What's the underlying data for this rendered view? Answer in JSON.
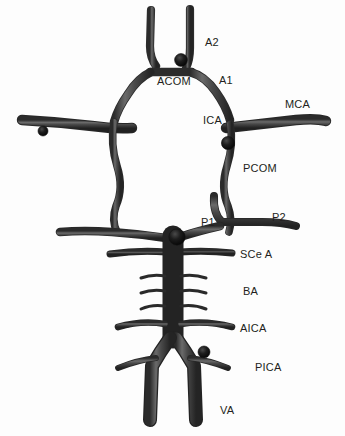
{
  "figure": {
    "background_color": "#fdfdfd",
    "vessel_color": "#3f3f3f",
    "vessel_shadow_color": "#262626",
    "vessel_highlight_color": "#6e6e6e",
    "aneurysm_color": "#131313",
    "label_color": "#231f20"
  },
  "labels": [
    {
      "id": "a2",
      "text": "A2",
      "x": 205,
      "y": 37,
      "artery": "anterior-cerebral-artery-a2-segment"
    },
    {
      "id": "acom",
      "text": "ACOM",
      "x": 157,
      "y": 76,
      "artery": "anterior-communicating-artery"
    },
    {
      "id": "a1",
      "text": "A1",
      "x": 219,
      "y": 75,
      "artery": "anterior-cerebral-artery-a1-segment"
    },
    {
      "id": "mca",
      "text": "MCA",
      "x": 285,
      "y": 99,
      "artery": "middle-cerebral-artery"
    },
    {
      "id": "ica",
      "text": "ICA",
      "x": 203,
      "y": 115,
      "artery": "internal-carotid-artery"
    },
    {
      "id": "pcom",
      "text": "PCOM",
      "x": 243,
      "y": 163,
      "artery": "posterior-communicating-artery"
    },
    {
      "id": "p1",
      "text": "P1",
      "x": 201,
      "y": 217,
      "artery": "posterior-cerebral-artery-p1-segment"
    },
    {
      "id": "p2",
      "text": "P2",
      "x": 272,
      "y": 212,
      "artery": "posterior-cerebral-artery-p2-segment"
    },
    {
      "id": "scea",
      "text": "SCe A",
      "x": 240,
      "y": 249,
      "artery": "superior-cerebellar-artery"
    },
    {
      "id": "ba",
      "text": "BA",
      "x": 243,
      "y": 286,
      "artery": "basilar-artery"
    },
    {
      "id": "aica",
      "text": "AICA",
      "x": 240,
      "y": 323,
      "artery": "anterior-inferior-cerebellar-artery"
    },
    {
      "id": "pica",
      "text": "PICA",
      "x": 255,
      "y": 362,
      "artery": "posterior-inferior-cerebellar-artery"
    },
    {
      "id": "va",
      "text": "VA",
      "x": 220,
      "y": 405,
      "artery": "vertebral-artery"
    }
  ],
  "aneurysms": [
    {
      "id": "acom-aneurysm",
      "cx": 181,
      "cy": 60,
      "r": 6.4,
      "location": "anterior-communicating-artery"
    },
    {
      "id": "pcom-aneurysm",
      "cx": 228,
      "cy": 143,
      "r": 6.6,
      "location": "posterior-communicating-artery-origin"
    },
    {
      "id": "mca-left-aneurysm",
      "cx": 43,
      "cy": 131,
      "r": 5.0,
      "location": "left-middle-cerebral-artery"
    },
    {
      "id": "basilar-tip-aneurysm",
      "cx": 177,
      "cy": 237,
      "r": 8.2,
      "location": "basilar-artery-apex"
    },
    {
      "id": "pica-aneurysm",
      "cx": 204,
      "cy": 352,
      "r": 6.0,
      "location": "posterior-inferior-cerebellar-artery-origin"
    }
  ],
  "vessels": [
    {
      "id": "a2-left",
      "name": "left-a2-segment"
    },
    {
      "id": "a2-right",
      "name": "right-a2-segment"
    },
    {
      "id": "acom-segment",
      "name": "anterior-communicating-artery"
    },
    {
      "id": "a1-left",
      "name": "left-a1-segment"
    },
    {
      "id": "a1-right",
      "name": "right-a1-segment"
    },
    {
      "id": "ica-left",
      "name": "left-internal-carotid-artery"
    },
    {
      "id": "ica-right",
      "name": "right-internal-carotid-artery"
    },
    {
      "id": "mca-left",
      "name": "left-middle-cerebral-artery"
    },
    {
      "id": "mca-right",
      "name": "right-middle-cerebral-artery"
    },
    {
      "id": "pcom-left",
      "name": "left-posterior-communicating-artery"
    },
    {
      "id": "pcom-right",
      "name": "right-posterior-communicating-artery"
    },
    {
      "id": "p1-p2-left",
      "name": "left-posterior-cerebral-artery"
    },
    {
      "id": "p1-p2-right",
      "name": "right-posterior-cerebral-artery"
    },
    {
      "id": "scea-left",
      "name": "left-superior-cerebellar-artery"
    },
    {
      "id": "scea-right",
      "name": "right-superior-cerebellar-artery"
    },
    {
      "id": "basilar-trunk",
      "name": "basilar-artery-trunk"
    },
    {
      "id": "pontine-branches",
      "name": "pontine-perforating-branches",
      "count": 6
    },
    {
      "id": "aica-left",
      "name": "left-anterior-inferior-cerebellar-artery"
    },
    {
      "id": "aica-right",
      "name": "right-anterior-inferior-cerebellar-artery"
    },
    {
      "id": "pica-left",
      "name": "left-posterior-inferior-cerebellar-artery"
    },
    {
      "id": "pica-right",
      "name": "right-posterior-inferior-cerebellar-artery"
    },
    {
      "id": "va-left",
      "name": "left-vertebral-artery"
    },
    {
      "id": "va-right",
      "name": "right-vertebral-artery"
    }
  ]
}
